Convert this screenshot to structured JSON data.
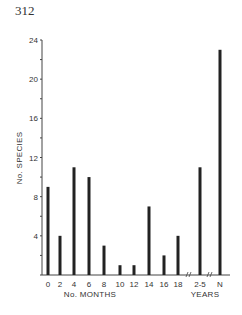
{
  "page": {
    "number": "312"
  },
  "chart_data": {
    "type": "bar",
    "title": "",
    "xlabel": "No. MONTHS",
    "xlabel_secondary": "YEARS",
    "ylabel": "No. SPECIES",
    "ylim": [
      0,
      24
    ],
    "yticks": [
      0,
      4,
      8,
      12,
      16,
      20,
      24
    ],
    "grid": false,
    "legend": null,
    "categories": [
      "0",
      "2",
      "4",
      "6",
      "8",
      "10",
      "12",
      "14",
      "16",
      "18",
      "2-5",
      "N"
    ],
    "values": [
      9,
      4,
      11,
      10,
      3,
      1,
      1,
      7,
      2,
      4,
      11,
      23
    ],
    "axis_breaks_after": [
      "18",
      "2-5"
    ]
  },
  "colors": {
    "bar": "#222222",
    "axis": "#444444",
    "background": "#ffffff"
  }
}
